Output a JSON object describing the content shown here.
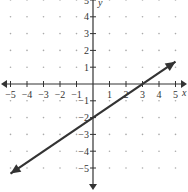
{
  "chart_data": {
    "type": "line",
    "title": "",
    "xlabel": "x",
    "ylabel": "y",
    "xlim": [
      -5,
      5
    ],
    "ylim": [
      -5,
      5
    ],
    "grid": "dots",
    "x_ticks": [
      "-5",
      "-4",
      "-3",
      "-2",
      "-1",
      "1",
      "2",
      "3",
      "4",
      "5"
    ],
    "y_ticks": [
      "5",
      "4",
      "3",
      "2",
      "1",
      "-1",
      "-2",
      "-3",
      "-4",
      "-5"
    ],
    "series": [
      {
        "name": "line",
        "equation": "y = (2/3)x - 2",
        "slope": 0.6667,
        "y_intercept": -2,
        "x_intercept": 3,
        "x": [
          -5,
          0,
          3,
          5
        ],
        "y": [
          -5.33,
          -2,
          0,
          1.33
        ],
        "arrows": "both ends",
        "color": "#333333"
      }
    ]
  },
  "labels": {
    "x_axis": "x",
    "y_axis": "y"
  },
  "colors": {
    "axis": "#333333",
    "line": "#333333",
    "grid_dot": "#aaaaaa"
  }
}
